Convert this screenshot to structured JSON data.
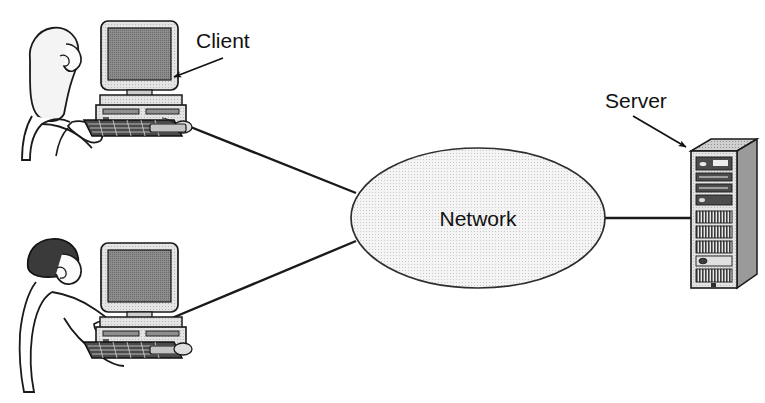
{
  "diagram": {
    "type": "network-topology",
    "background_color": "#ffffff",
    "line_color": "#1a1a1a",
    "nodes": {
      "network_cloud": {
        "label": "Network",
        "shape": "ellipse",
        "fill_color": "#ececec",
        "stroke_color": "#333333",
        "center_x": 478,
        "center_y": 218,
        "radius_x": 127,
        "radius_y": 70
      },
      "client_top": {
        "label": "Client",
        "kind": "desktop-workstation-with-user",
        "user_hair_color": "#f2f2f2",
        "monitor_bezel_color": "#e8e8e8",
        "monitor_screen_color": "#7a7a7a",
        "case_color": "#d8d8d8",
        "keyboard_color": "#4a4a4a"
      },
      "client_bottom": {
        "label": "",
        "kind": "desktop-workstation-with-user",
        "user_hair_color": "#3a3a3a",
        "monitor_bezel_color": "#e8e8e8",
        "monitor_screen_color": "#7a7a7a",
        "case_color": "#d8d8d8",
        "keyboard_color": "#4a4a4a"
      },
      "server_tower": {
        "label": "Server",
        "kind": "tower-server",
        "front_color": "#d4d4d4",
        "side_color": "#9a9a9a",
        "top_color": "#c2c2c2",
        "bay_color": "#4c4c4c",
        "vent_color": "#3a3a3a"
      }
    },
    "annotations": [
      {
        "id": "client-annotation",
        "text": "Client",
        "text_x": 196,
        "text_y": 48,
        "font_size": 21,
        "arrow_from_x": 223,
        "arrow_from_y": 58,
        "arrow_to_x": 172,
        "arrow_to_y": 78
      },
      {
        "id": "server-annotation",
        "text": "Server",
        "text_x": 605,
        "text_y": 108,
        "font_size": 21,
        "arrow_from_x": 633,
        "arrow_from_y": 116,
        "arrow_to_x": 688,
        "arrow_to_y": 148
      }
    ],
    "links": [
      {
        "id": "link-client-top-to-network",
        "from": "client_top",
        "to": "network_cloud",
        "x1": 178,
        "y1": 122,
        "x2": 356,
        "y2": 193
      },
      {
        "id": "link-client-bottom-to-network",
        "from": "client_bottom",
        "to": "network_cloud",
        "x1": 172,
        "y1": 318,
        "x2": 356,
        "y2": 241
      },
      {
        "id": "link-network-to-server",
        "from": "network_cloud",
        "to": "server_tower",
        "x1": 605,
        "y1": 218,
        "x2": 691,
        "y2": 218
      }
    ]
  }
}
